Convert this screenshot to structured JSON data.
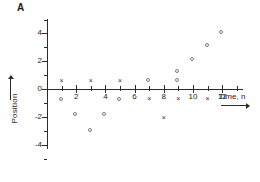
{
  "panel": {
    "label": "A"
  },
  "chart_data": {
    "type": "scatter",
    "title": "",
    "xlabel": "Time, n",
    "ylabel": "Position",
    "xlim": [
      -0.5,
      13.0
    ],
    "ylim": [
      -5.0,
      5.2
    ],
    "grid": false,
    "legend": null,
    "x_ticks_major": [
      2,
      4,
      6,
      8,
      10,
      12
    ],
    "x_ticks_minor": [
      1,
      3,
      5,
      7,
      9,
      11,
      13
    ],
    "x_tick_labels": [
      "2",
      "4",
      "6",
      "8",
      "10",
      "12"
    ],
    "y_ticks_major": [
      -4,
      -2,
      0,
      2,
      4
    ],
    "y_ticks_minor": [
      -5,
      -3,
      -1,
      1,
      3,
      5
    ],
    "y_tick_labels": [
      "4",
      "2",
      "0",
      "-2",
      "-4"
    ],
    "series": [
      {
        "name": "cross-series",
        "marker": "x",
        "color": "#2b2b2b",
        "points": [
          {
            "x": 1,
            "y": 0.6
          },
          {
            "x": 3,
            "y": 0.6
          },
          {
            "x": 5,
            "y": 0.6
          },
          {
            "x": 7,
            "y": -0.7
          },
          {
            "x": 9,
            "y": -0.7
          },
          {
            "x": 11,
            "y": -0.7
          },
          {
            "x": 8,
            "y": -2.1
          }
        ]
      },
      {
        "name": "circle-series",
        "marker": "o",
        "color": "#7b7b86",
        "points": [
          {
            "x": 1,
            "y": -0.8
          },
          {
            "x": 2,
            "y": -1.9
          },
          {
            "x": 3,
            "y": -3.0
          },
          {
            "x": 4,
            "y": -1.9
          },
          {
            "x": 5,
            "y": -0.8
          },
          {
            "x": 7,
            "y": 0.6
          },
          {
            "x": 9,
            "y": 0.6
          },
          {
            "x": 9,
            "y": 1.2
          },
          {
            "x": 10,
            "y": 2.1
          },
          {
            "x": 11,
            "y": 3.1
          },
          {
            "x": 12,
            "y": 4.0
          }
        ]
      }
    ]
  }
}
